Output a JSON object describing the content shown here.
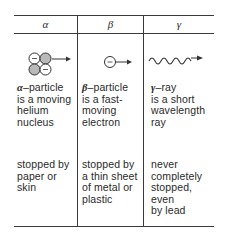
{
  "table": {
    "columns": [
      {
        "header": "α",
        "icon": "alpha-particle-icon",
        "symbol": "α",
        "description": "–particle is a moving helium nucleus",
        "desc_lines": [
          "particle",
          "is a moving",
          "helium",
          "nucleus"
        ],
        "stopping": [
          "stopped by",
          "paper or",
          "skin"
        ]
      },
      {
        "header": "β",
        "icon": "beta-particle-icon",
        "symbol": "β",
        "description": "–particle is a fast-moving electron",
        "desc_lines": [
          "particle",
          "is a fast-",
          "moving",
          "electron"
        ],
        "stopping": [
          "stopped by",
          "a thin sheet",
          "of metal or",
          "plastic"
        ]
      },
      {
        "header": "γ",
        "icon": "gamma-ray-icon",
        "symbol": "γ",
        "description": "–ray is a short wavelength ray",
        "desc_lines": [
          "ray",
          "is a short",
          "wavelength",
          "ray"
        ],
        "stopping": [
          "never",
          "completely",
          "stopped, even",
          "by lead"
        ]
      }
    ]
  },
  "colors": {
    "line": "#3a3a3a",
    "text": "#2a2a2a",
    "proton_fill": "#b8b8b8",
    "neutron_fill": "#ffffff"
  }
}
